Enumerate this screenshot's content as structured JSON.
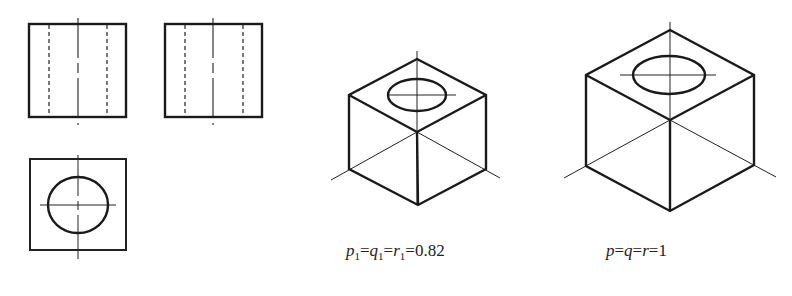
{
  "figure": {
    "orthographic_views": {
      "front_view": {
        "label": "front view",
        "box": [
          29,
          24,
          126,
          117
        ],
        "hidden_lines_x": [
          49,
          107
        ],
        "centerline_x": 78
      },
      "side_view": {
        "label": "side view",
        "box": [
          165,
          24,
          262,
          117
        ],
        "hidden_lines_x": [
          185,
          243
        ],
        "centerline_x": 213
      },
      "top_view": {
        "label": "top view",
        "box": [
          30,
          159,
          126,
          250
        ],
        "circle": {
          "cx": 78,
          "cy": 205,
          "rx": 30,
          "ry": 28
        }
      }
    },
    "isometric_simplified": {
      "caption": {
        "p": "p",
        "q": "q",
        "r": "r",
        "sub": "1",
        "eq": "=",
        "value": "0.82"
      }
    },
    "isometric_standard": {
      "caption": {
        "p": "p",
        "q": "q",
        "r": "r",
        "eq": "=",
        "value": "1"
      }
    }
  },
  "colors": {
    "line": "#1a1a1a",
    "background": "#ffffff"
  }
}
